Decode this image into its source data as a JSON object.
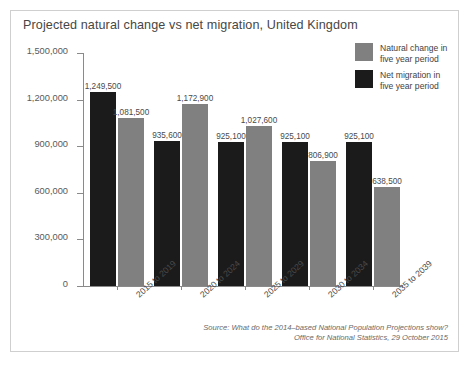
{
  "card": {
    "title": "Projected natural change vs net migration, United Kingdom"
  },
  "legend": {
    "items": [
      {
        "key": "natural",
        "label": "Natural change in five year period",
        "color": "#808080"
      },
      {
        "key": "net",
        "label": "Net migration in five year period",
        "color": "#1b1b1b"
      }
    ]
  },
  "source": {
    "line1": "Source: What do the 2014–based National Population Projections show?",
    "line2": "Office for National Statistics, 29 October 2015"
  },
  "chart_data": {
    "type": "bar",
    "title": "Projected natural change vs net migration, United Kingdom",
    "xlabel": "",
    "ylabel": "",
    "ylim": [
      0,
      1500000
    ],
    "yticks": [
      0,
      300000,
      600000,
      900000,
      1200000,
      1500000
    ],
    "ytick_labels": [
      "0",
      "300,000",
      "600,000",
      "900,000",
      "1,200,000",
      "1,500,000"
    ],
    "grid": false,
    "legend_position": "top-right",
    "categories": [
      "2015 to 2019",
      "2020 to 2024",
      "2025 to 2029",
      "2030 to 2034",
      "2035 to 2039"
    ],
    "series": [
      {
        "name": "Net migration in five year period",
        "color": "#1b1b1b",
        "values": [
          1249500,
          935600,
          925100,
          925100,
          925100
        ],
        "labels": [
          "1,249,500",
          "935,600",
          "925,100",
          "925,100",
          "925,100"
        ]
      },
      {
        "name": "Natural change in five year period",
        "color": "#808080",
        "values": [
          1081500,
          1172900,
          1027600,
          806900,
          638500
        ],
        "labels": [
          "1,081,500",
          "1,172,900",
          "1,027,600",
          "806,900",
          "638,500"
        ]
      }
    ]
  }
}
